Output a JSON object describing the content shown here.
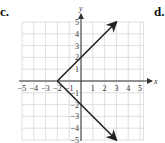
{
  "labels": {
    "left": "c.",
    "right": "d."
  },
  "graph": {
    "x_axis_label": "x",
    "y_axis_label": "y",
    "x_ticks": [
      "-5",
      "-4",
      "-3",
      "-2",
      "-1",
      "1",
      "2",
      "3",
      "4",
      "5"
    ],
    "y_ticks": [
      "5",
      "4",
      "3",
      "2",
      "1",
      "-1",
      "-2",
      "-3",
      "-4",
      "-5"
    ],
    "xlim": [
      -5,
      5
    ],
    "ylim": [
      -5,
      5
    ],
    "vertex": [
      -2,
      0
    ],
    "rays": [
      {
        "from": [
          -2,
          0
        ],
        "to": [
          3,
          5
        ]
      },
      {
        "from": [
          -2,
          0
        ],
        "to": [
          3,
          -5
        ]
      }
    ],
    "function": "y = |x + 2| (both branches, ±)",
    "colors": {
      "grid": "#d8d8d8",
      "axis": "#333333",
      "line": "#222222"
    }
  }
}
